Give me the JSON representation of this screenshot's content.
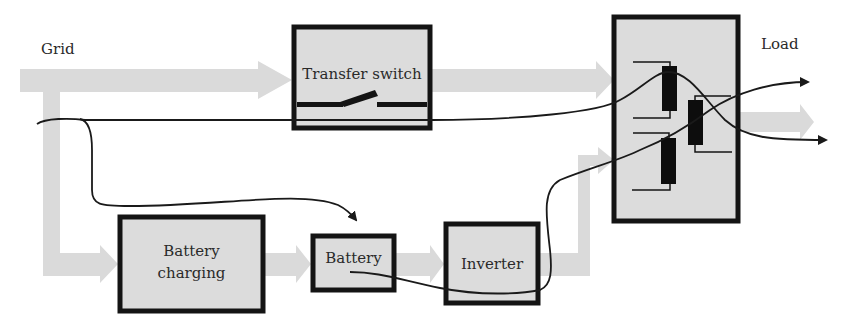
{
  "diagram": {
    "type": "block-diagram",
    "title": "",
    "labels": {
      "grid": "Grid",
      "load": "Load"
    },
    "blocks": {
      "transfer_switch": "Transfer switch",
      "battery_charging_line1": "Battery",
      "battery_charging_line2": "charging",
      "battery": "Battery",
      "inverter": "Inverter",
      "static_switch": ""
    },
    "colors": {
      "power_flow_arrow": "#d9d9d9",
      "block_fill": "#dcdcdc",
      "block_border": "#141414",
      "signal_line": "#1a1a1a",
      "text": "#2a2a2a"
    },
    "connections": [
      {
        "from": "Grid",
        "to": "Transfer switch",
        "kind": "power-flow"
      },
      {
        "from": "Transfer switch",
        "to": "Static switch",
        "kind": "power-flow"
      },
      {
        "from": "Grid",
        "to": "Battery charging",
        "kind": "power-flow"
      },
      {
        "from": "Battery charging",
        "to": "Battery",
        "kind": "power-flow"
      },
      {
        "from": "Battery",
        "to": "Inverter",
        "kind": "power-flow"
      },
      {
        "from": "Inverter",
        "to": "Static switch",
        "kind": "power-flow"
      },
      {
        "from": "Static switch",
        "to": "Load",
        "kind": "power-flow"
      },
      {
        "from": "Grid",
        "to": "Load",
        "kind": "signal-path",
        "via": "Transfer switch"
      },
      {
        "from": "Grid",
        "to": "Battery",
        "kind": "signal-path"
      },
      {
        "from": "Battery",
        "to": "Load",
        "kind": "signal-path",
        "via": "Inverter"
      }
    ]
  }
}
